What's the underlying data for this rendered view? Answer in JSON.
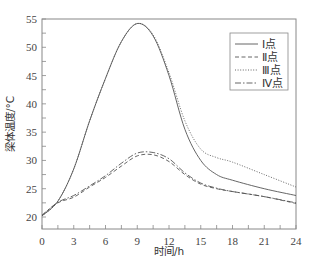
{
  "chart_data": {
    "type": "line",
    "title": "",
    "xlabel": "时间/h",
    "ylabel": "梁体温度/°C",
    "xlim": [
      0,
      24
    ],
    "ylim": [
      18,
      55
    ],
    "xticks": [
      0,
      3,
      6,
      9,
      12,
      15,
      18,
      21,
      24
    ],
    "yticks": [
      20,
      25,
      30,
      35,
      40,
      45,
      50,
      55
    ],
    "grid": false,
    "legend_position": "upper right",
    "series": [
      {
        "name": "Ⅰ点",
        "style": "solid",
        "x": [
          0,
          1.5,
          3,
          4.5,
          6,
          7.5,
          9,
          10.5,
          12,
          13.5,
          15,
          16.5,
          18,
          21,
          24
        ],
        "values": [
          20.2,
          22.8,
          28.5,
          37,
          44.5,
          51,
          54.2,
          52,
          45,
          35.5,
          30,
          27.5,
          26.5,
          25,
          23.8
        ]
      },
      {
        "name": "Ⅱ点",
        "style": "dashed",
        "x": [
          0,
          1.5,
          3,
          4.5,
          6,
          7.5,
          9,
          10.5,
          12,
          13.5,
          15,
          16.5,
          18,
          21,
          24
        ],
        "values": [
          20.3,
          22.5,
          23.5,
          25.3,
          27,
          29,
          30.8,
          31,
          29.8,
          27.5,
          25.8,
          25,
          24.5,
          23.6,
          22.4
        ]
      },
      {
        "name": "Ⅲ点",
        "style": "dotted",
        "x": [
          0,
          1.5,
          3,
          4.5,
          6,
          7.5,
          9,
          10.5,
          12,
          13.5,
          15,
          16.5,
          18,
          21,
          24
        ],
        "values": [
          20.2,
          22.8,
          28.5,
          37,
          44.5,
          51,
          54.2,
          52.2,
          45.5,
          37,
          32,
          30.5,
          29.7,
          27.5,
          25.3
        ]
      },
      {
        "name": "Ⅳ点",
        "style": "dash-dot",
        "x": [
          0,
          1.5,
          3,
          4.5,
          6,
          7.5,
          9,
          10.5,
          12,
          13.5,
          15,
          16.5,
          18,
          21,
          24
        ],
        "values": [
          20.3,
          22.6,
          23.8,
          25.5,
          27.3,
          29.5,
          31.3,
          31.4,
          30.3,
          27.8,
          26,
          25.1,
          24.5,
          23.6,
          22.5
        ]
      }
    ]
  },
  "axes": {
    "x_title": "时间/h",
    "y_title": "梁体温度/°C",
    "x_tick_labels": [
      "0",
      "3",
      "6",
      "9",
      "12",
      "15",
      "18",
      "21",
      "24"
    ],
    "y_tick_labels": [
      "20",
      "25",
      "30",
      "35",
      "40",
      "45",
      "50",
      "55"
    ]
  },
  "legend": {
    "items": [
      {
        "label": "Ⅰ点",
        "style": "solid"
      },
      {
        "label": "Ⅱ点",
        "style": "dashed"
      },
      {
        "label": "Ⅲ点",
        "style": "dotted"
      },
      {
        "label": "Ⅳ点",
        "style": "dash-dot"
      }
    ]
  },
  "colors": {
    "line": "#555555",
    "axis": "#777777",
    "text": "#333333"
  }
}
